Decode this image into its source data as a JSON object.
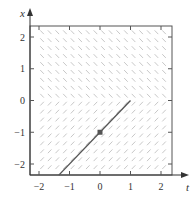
{
  "chart_data": {
    "type": "slope-field",
    "title": "",
    "xlabel": "t",
    "ylabel": "x",
    "xlim": [
      -2.3,
      2.35
    ],
    "ylim": [
      -2.35,
      2.35
    ],
    "xticks": [
      -2,
      -1,
      0,
      1,
      2
    ],
    "yticks": [
      -2,
      -1,
      0,
      1,
      2
    ],
    "xtick_labels": [
      "−2",
      "−1",
      "0",
      "1",
      "2"
    ],
    "ytick_labels": [
      "−2",
      "−1",
      "0",
      "1",
      "2"
    ],
    "grid": false,
    "legend": null,
    "slope_field": {
      "description": "dx/dt = -1 for x >= 0, +1 for x < 0",
      "t_range": [
        -1.9,
        2.15
      ],
      "x_range": [
        -2.1,
        2.15
      ],
      "step": 0.25,
      "slope_above": -1,
      "slope_below": 1,
      "color": "#c8c8c8"
    },
    "series": [
      {
        "name": "solution",
        "type": "line",
        "points": [
          [
            -1.35,
            -2.35
          ],
          [
            1.0,
            0.0
          ]
        ],
        "color": "#555555"
      }
    ],
    "markers": [
      {
        "name": "initial-point",
        "t": 0,
        "x": -1,
        "color": "#555555"
      }
    ]
  },
  "axes": {
    "x_label": "t",
    "y_label": "x",
    "x_ticks": [
      "−2",
      "−1",
      "0",
      "1",
      "2"
    ],
    "y_ticks": [
      "−2",
      "−1",
      "0",
      "1",
      "2"
    ]
  }
}
